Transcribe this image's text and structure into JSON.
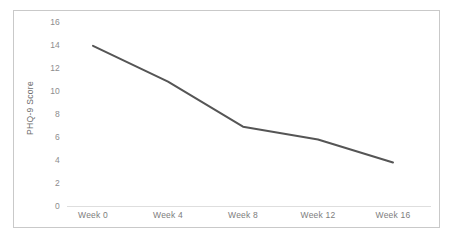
{
  "chart_data": {
    "type": "line",
    "title": "",
    "xlabel": "",
    "ylabel": "PHQ-9 Score",
    "categories": [
      "Week 0",
      "Week 4",
      "Week 8",
      "Week 12",
      "Week 16"
    ],
    "x": [
      0,
      4,
      8,
      12,
      16
    ],
    "values": [
      13.9,
      10.8,
      6.9,
      5.8,
      3.8
    ],
    "series": [
      {
        "name": "PHQ-9 Score",
        "values": [
          13.9,
          10.8,
          6.9,
          5.8,
          3.8
        ]
      }
    ],
    "ylim": [
      0,
      16
    ],
    "yticks": [
      0,
      2,
      4,
      6,
      8,
      10,
      12,
      14,
      16
    ],
    "ytick_labels": [
      "0",
      "2",
      "4",
      "6",
      "8",
      "10",
      "12",
      "14",
      "16"
    ],
    "grid": false,
    "legend": false,
    "legend_position": "none",
    "line_color": "#555555",
    "axis_color": "#d8d8d8",
    "tick_label_color": "#8d8d8d",
    "frame_color": "#c9c9c9",
    "background_color": "#ffffff"
  }
}
